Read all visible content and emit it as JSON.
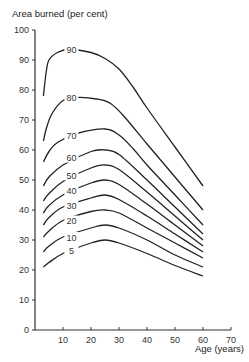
{
  "chart_data": {
    "type": "line",
    "title": "",
    "ylabel": "Area burned (per cent)",
    "xlabel": "Age (years)",
    "xlim": [
      0,
      70
    ],
    "ylim": [
      0,
      100
    ],
    "xticks": [
      10,
      20,
      30,
      40,
      50,
      60,
      70
    ],
    "yticks": [
      0,
      10,
      20,
      30,
      40,
      50,
      60,
      70,
      80,
      90,
      100
    ],
    "grid": false,
    "legend": "inline curve labels",
    "series": [
      {
        "name": "90",
        "label_at": [
          13,
          93.5
        ],
        "points": [
          [
            3,
            78
          ],
          [
            4,
            86
          ],
          [
            5,
            90
          ],
          [
            8,
            92.5
          ],
          [
            12,
            93.5
          ],
          [
            20,
            92.5
          ],
          [
            25,
            90.5
          ],
          [
            30,
            87
          ],
          [
            35,
            81
          ],
          [
            40,
            74
          ],
          [
            50,
            61
          ],
          [
            60,
            48
          ]
        ]
      },
      {
        "name": "80",
        "label_at": [
          13,
          77.5
        ],
        "points": [
          [
            3,
            63
          ],
          [
            4,
            67
          ],
          [
            6,
            72
          ],
          [
            10,
            76.5
          ],
          [
            15,
            77.5
          ],
          [
            22,
            77
          ],
          [
            27,
            75.5
          ],
          [
            32,
            71
          ],
          [
            40,
            62
          ],
          [
            50,
            51
          ],
          [
            60,
            40
          ]
        ]
      },
      {
        "name": "70",
        "label_at": [
          13,
          65
        ],
        "points": [
          [
            3,
            56
          ],
          [
            5,
            59.5
          ],
          [
            8,
            62.5
          ],
          [
            15,
            65.5
          ],
          [
            25,
            67
          ],
          [
            30,
            65
          ],
          [
            35,
            60.5
          ],
          [
            40,
            55
          ],
          [
            50,
            45
          ],
          [
            60,
            35
          ]
        ]
      },
      {
        "name": "60",
        "label_at": [
          13,
          57.5
        ],
        "points": [
          [
            3,
            48
          ],
          [
            5,
            51
          ],
          [
            10,
            55
          ],
          [
            20,
            59.5
          ],
          [
            25,
            60
          ],
          [
            30,
            58.5
          ],
          [
            40,
            50
          ],
          [
            50,
            41
          ],
          [
            60,
            32
          ]
        ]
      },
      {
        "name": "50",
        "label_at": [
          13,
          51.5
        ],
        "points": [
          [
            3,
            43
          ],
          [
            5,
            45.5
          ],
          [
            10,
            49.5
          ],
          [
            20,
            54
          ],
          [
            25,
            55
          ],
          [
            30,
            53.5
          ],
          [
            40,
            46
          ],
          [
            50,
            38
          ],
          [
            60,
            30
          ]
        ]
      },
      {
        "name": "40",
        "label_at": [
          13,
          46.5
        ],
        "points": [
          [
            3,
            39
          ],
          [
            5,
            41.5
          ],
          [
            10,
            45
          ],
          [
            20,
            49
          ],
          [
            25,
            50
          ],
          [
            30,
            48.5
          ],
          [
            40,
            42
          ],
          [
            50,
            35
          ],
          [
            60,
            28
          ]
        ]
      },
      {
        "name": "30",
        "label_at": [
          13,
          41.5
        ],
        "points": [
          [
            3,
            35
          ],
          [
            5,
            37.5
          ],
          [
            10,
            41
          ],
          [
            20,
            44
          ],
          [
            25,
            45
          ],
          [
            30,
            43.5
          ],
          [
            40,
            38
          ],
          [
            50,
            32
          ],
          [
            60,
            26
          ]
        ]
      },
      {
        "name": "20",
        "label_at": [
          13,
          36.5
        ],
        "points": [
          [
            3,
            31
          ],
          [
            5,
            33
          ],
          [
            10,
            36.5
          ],
          [
            20,
            39.5
          ],
          [
            25,
            40
          ],
          [
            30,
            39
          ],
          [
            40,
            34
          ],
          [
            50,
            29
          ],
          [
            60,
            24
          ]
        ]
      },
      {
        "name": "10",
        "label_at": [
          13,
          31
        ],
        "points": [
          [
            3,
            26
          ],
          [
            5,
            28
          ],
          [
            10,
            31
          ],
          [
            20,
            34
          ],
          [
            25,
            35
          ],
          [
            30,
            34
          ],
          [
            40,
            30
          ],
          [
            50,
            25
          ],
          [
            60,
            21
          ]
        ]
      },
      {
        "name": "5",
        "label_at": [
          13,
          26.5
        ],
        "points": [
          [
            3,
            21
          ],
          [
            5,
            22.5
          ],
          [
            10,
            25.5
          ],
          [
            20,
            29
          ],
          [
            25,
            30
          ],
          [
            30,
            29
          ],
          [
            40,
            25.5
          ],
          [
            50,
            21.5
          ],
          [
            60,
            18
          ]
        ]
      }
    ]
  },
  "labels": {
    "y_axis_title": "Area burned (per cent)",
    "x_axis_title": "Age (years)"
  }
}
